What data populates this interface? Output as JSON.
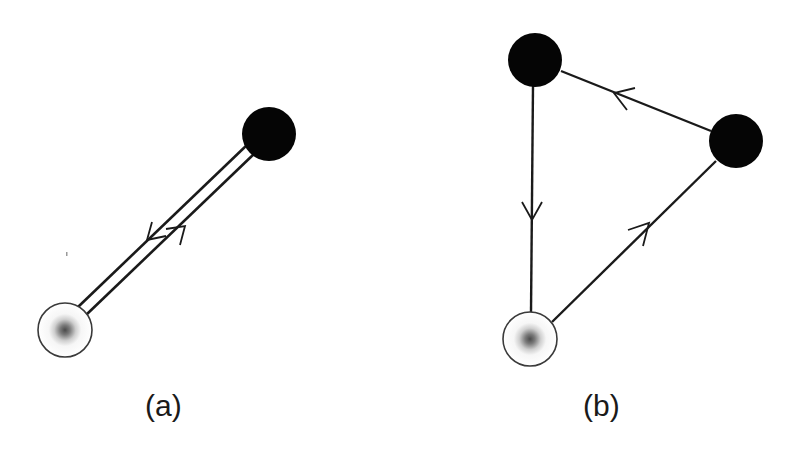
{
  "colors": {
    "line": "#1a1a1a",
    "black_node": "#050505",
    "white_node_fill": "#ffffff",
    "white_node_stroke": "#3a3a3a",
    "white_node_center": "#555555"
  },
  "diagram_a": {
    "label": "(a)",
    "nodes": [
      {
        "id": "a-white",
        "type": "white-gray-center",
        "cx": 65,
        "cy": 330,
        "r": 27
      },
      {
        "id": "a-black",
        "type": "black",
        "cx": 269,
        "cy": 134,
        "r": 27
      }
    ],
    "edges": [
      {
        "from": "a-black",
        "to": "a-white",
        "arrow": "toward-white",
        "position": "upper-parallel"
      },
      {
        "from": "a-white",
        "to": "a-black",
        "arrow": "toward-black",
        "position": "lower-parallel"
      }
    ]
  },
  "diagram_b": {
    "label": "(b)",
    "nodes": [
      {
        "id": "b-black-top",
        "type": "black",
        "cx": 535,
        "cy": 60,
        "r": 27
      },
      {
        "id": "b-black-right",
        "type": "black",
        "cx": 736,
        "cy": 141,
        "r": 27
      },
      {
        "id": "b-white",
        "type": "white-gray-center",
        "cx": 530,
        "cy": 339,
        "r": 27
      }
    ],
    "edges": [
      {
        "from": "b-white",
        "to": "b-black-right",
        "arrow": "up-right"
      },
      {
        "from": "b-black-right",
        "to": "b-black-top",
        "arrow": "left"
      },
      {
        "from": "b-black-top",
        "to": "b-white",
        "arrow": "down"
      }
    ]
  }
}
